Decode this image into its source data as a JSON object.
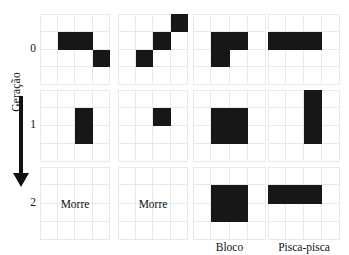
{
  "figure": {
    "axis": {
      "label": "Geração",
      "arrow_direction": "down"
    },
    "generations": [
      {
        "tick": "0"
      },
      {
        "tick": "1"
      },
      {
        "tick": "2"
      }
    ],
    "grid_size": {
      "cols": 4,
      "rows": 4
    },
    "colors": {
      "alive_cell": "#171717",
      "grid_line": "#e9e9e9",
      "background": "#ffffff",
      "text": "#111111"
    },
    "columns": [
      {
        "name": "column-1",
        "caption": "",
        "states": [
          {
            "generation": "0",
            "live_cells": [
              [
                1,
                1
              ],
              [
                1,
                2
              ],
              [
                2,
                3
              ]
            ],
            "text": ""
          },
          {
            "generation": "1",
            "live_cells": [
              [
                1,
                2
              ],
              [
                2,
                2
              ]
            ],
            "text": ""
          },
          {
            "generation": "2",
            "live_cells": [],
            "text": "Morre"
          }
        ]
      },
      {
        "name": "column-2",
        "caption": "",
        "states": [
          {
            "generation": "0",
            "live_cells": [
              [
                0,
                3
              ],
              [
                1,
                2
              ],
              [
                2,
                1
              ]
            ],
            "text": ""
          },
          {
            "generation": "1",
            "live_cells": [
              [
                1,
                2
              ]
            ],
            "text": ""
          },
          {
            "generation": "2",
            "live_cells": [],
            "text": "Morre"
          }
        ]
      },
      {
        "name": "column-3",
        "caption": "Bloco",
        "states": [
          {
            "generation": "0",
            "live_cells": [
              [
                1,
                1
              ],
              [
                1,
                2
              ],
              [
                2,
                1
              ]
            ],
            "text": ""
          },
          {
            "generation": "1",
            "live_cells": [
              [
                1,
                1
              ],
              [
                1,
                2
              ],
              [
                2,
                1
              ],
              [
                2,
                2
              ]
            ],
            "text": ""
          },
          {
            "generation": "2",
            "live_cells": [
              [
                1,
                1
              ],
              [
                1,
                2
              ],
              [
                2,
                1
              ],
              [
                2,
                2
              ]
            ],
            "text": ""
          }
        ]
      },
      {
        "name": "column-4",
        "caption": "Pisca-pisca",
        "states": [
          {
            "generation": "0",
            "live_cells": [
              [
                1,
                0
              ],
              [
                1,
                1
              ],
              [
                1,
                2
              ]
            ],
            "text": ""
          },
          {
            "generation": "1",
            "live_cells": [
              [
                0,
                2
              ],
              [
                1,
                2
              ],
              [
                2,
                2
              ]
            ],
            "text": ""
          },
          {
            "generation": "2",
            "live_cells": [
              [
                1,
                0
              ],
              [
                1,
                1
              ],
              [
                1,
                2
              ]
            ],
            "text": ""
          }
        ]
      }
    ]
  }
}
